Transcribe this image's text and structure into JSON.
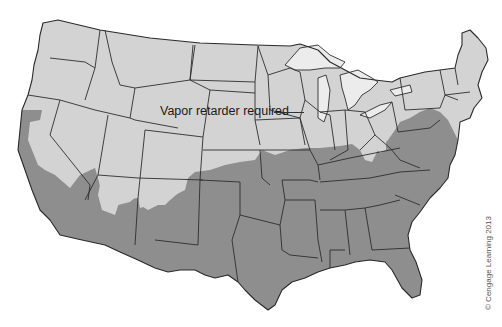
{
  "map": {
    "title_label": "Vapor retarder required",
    "credit": "© Cengage Learning 2013",
    "legend": [
      {
        "name": "Vapor retarder required",
        "color": "#d3d3d3"
      },
      {
        "name": "No vapor retarder required",
        "color": "#8e8e8e"
      }
    ],
    "region_colors": {
      "required": "#d3d3d3",
      "not_required": "#8e8e8e",
      "water": "#ececec",
      "border": "#2e2e2e",
      "background": "#ffffff"
    }
  }
}
